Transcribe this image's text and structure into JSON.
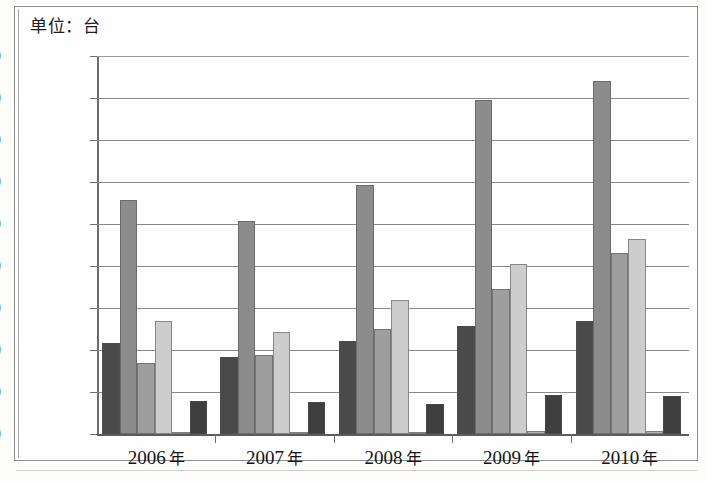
{
  "caption": {
    "unit_label": "单位：台"
  },
  "chart_data": {
    "type": "bar",
    "title": "单位：台",
    "xlabel": "",
    "ylabel": "",
    "ylim": [
      0,
      45000
    ],
    "ytick_step": 5000,
    "grid": true,
    "legend_position": "none",
    "categories": [
      "2006 年",
      "2007 年",
      "2008 年",
      "2009 年",
      "2010 年"
    ],
    "category_numbers": [
      "2006",
      "2007",
      "2008",
      "2009",
      "2010"
    ],
    "category_suffix": "年",
    "ytick_labels": [
      "0",
      "5000",
      "10000",
      "15000",
      "20000",
      "25000",
      "30000",
      "35000",
      "40000",
      "45000"
    ],
    "ytick_values": [
      0,
      5000,
      10000,
      15000,
      20000,
      25000,
      30000,
      35000,
      40000,
      45000
    ],
    "series": [
      {
        "name": "series-1",
        "color": "#4a4a4a",
        "values": [
          10800,
          9200,
          11100,
          12900,
          13500
        ]
      },
      {
        "name": "series-2",
        "color": "#8c8c8c",
        "values": [
          27800,
          25300,
          29600,
          39800,
          42000
        ]
      },
      {
        "name": "series-3",
        "color": "#9e9e9e",
        "values": [
          8400,
          9400,
          12500,
          17300,
          21600
        ]
      },
      {
        "name": "series-4",
        "color": "#cdcdcd",
        "values": [
          13400,
          12200,
          16000,
          20200,
          23200
        ]
      },
      {
        "name": "series-5",
        "color": "#b5b5b5",
        "values": [
          200,
          200,
          200,
          300,
          300
        ]
      },
      {
        "name": "series-6",
        "color": "#3f3f3f",
        "values": [
          3900,
          3800,
          3600,
          4700,
          4500
        ]
      }
    ]
  }
}
